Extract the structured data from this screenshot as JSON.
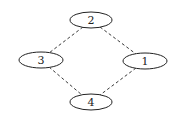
{
  "diagram": {
    "type": "undirected-graph",
    "nodes": [
      {
        "id": "1",
        "label": "1",
        "cx": 145,
        "cy": 61,
        "rx": 22,
        "ry": 8
      },
      {
        "id": "2",
        "label": "2",
        "cx": 91,
        "cy": 20,
        "rx": 21,
        "ry": 8
      },
      {
        "id": "3",
        "label": "3",
        "cx": 41,
        "cy": 60,
        "rx": 22,
        "ry": 8
      },
      {
        "id": "4",
        "label": "4",
        "cx": 91,
        "cy": 102,
        "rx": 21,
        "ry": 8
      }
    ],
    "edges": [
      {
        "from": "2",
        "to": "3",
        "style": "dashed",
        "x1": 83,
        "y1": 27,
        "x2": 49,
        "y2": 53
      },
      {
        "from": "2",
        "to": "1",
        "style": "dashed",
        "x1": 100,
        "y1": 27,
        "x2": 136,
        "y2": 54
      },
      {
        "from": "3",
        "to": "4",
        "style": "dashed",
        "x1": 49,
        "y1": 67,
        "x2": 82,
        "y2": 95
      },
      {
        "from": "1",
        "to": "4",
        "style": "dashed",
        "x1": 136,
        "y1": 68,
        "x2": 100,
        "y2": 95
      }
    ],
    "colors": {
      "stroke": "#222222",
      "background": "#ffffff"
    }
  }
}
